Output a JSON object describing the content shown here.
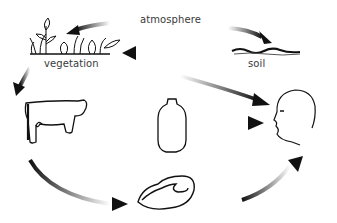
{
  "diagram": {
    "type": "cycle",
    "nodes": [
      {
        "id": "atmosphere",
        "label": "atmosphere",
        "icon": "atmosphere-label"
      },
      {
        "id": "soil",
        "label": "soil",
        "icon": "soil-icon"
      },
      {
        "id": "vegetation",
        "label": "vegetation",
        "icon": "vegetation-icon"
      },
      {
        "id": "cow",
        "label": "",
        "icon": "cow-icon"
      },
      {
        "id": "milk",
        "label": "",
        "icon": "milk-bottle-icon"
      },
      {
        "id": "meat",
        "label": "",
        "icon": "meat-steak-icon"
      },
      {
        "id": "human",
        "label": "",
        "icon": "human-head-icon"
      }
    ],
    "edges": [
      {
        "from": "atmosphere",
        "to": "vegetation"
      },
      {
        "from": "atmosphere",
        "to": "soil"
      },
      {
        "from": "soil",
        "to": "vegetation"
      },
      {
        "from": "vegetation",
        "to": "cow"
      },
      {
        "from": "vegetation",
        "to": "human"
      },
      {
        "from": "milk",
        "to": "human"
      },
      {
        "from": "cow",
        "to": "meat"
      },
      {
        "from": "meat",
        "to": "human"
      }
    ],
    "stroke_color": "#111111",
    "background": "#ffffff"
  }
}
